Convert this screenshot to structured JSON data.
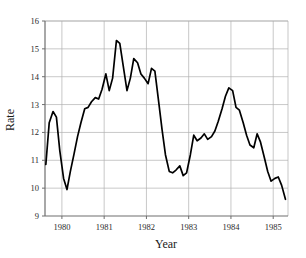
{
  "chart_data": {
    "type": "line",
    "title": "",
    "xlabel": "Year",
    "ylabel": "Rate",
    "xlim": [
      1979.6,
      1985.35
    ],
    "ylim": [
      9,
      16
    ],
    "grid": true,
    "legend": null,
    "x_ticks": [
      "1980",
      "1981",
      "1982",
      "1983",
      "1984",
      "1985"
    ],
    "x_tick_values": [
      1980,
      1981,
      1982,
      1983,
      1984,
      1985
    ],
    "y_ticks": [
      "9",
      "10",
      "11",
      "12",
      "13",
      "14",
      "15",
      "16"
    ],
    "y_tick_values": [
      9,
      10,
      11,
      12,
      13,
      14,
      15,
      16
    ],
    "series": [
      {
        "name": "Rate",
        "color": "#000000",
        "x": [
          1979.62,
          1979.7,
          1979.79,
          1979.87,
          1979.95,
          1980.04,
          1980.12,
          1980.2,
          1980.29,
          1980.37,
          1980.45,
          1980.54,
          1980.62,
          1980.7,
          1980.79,
          1980.87,
          1980.95,
          1981.04,
          1981.12,
          1981.2,
          1981.29,
          1981.37,
          1981.45,
          1981.54,
          1981.62,
          1981.7,
          1981.79,
          1981.87,
          1981.95,
          1982.04,
          1982.12,
          1982.2,
          1982.29,
          1982.37,
          1982.45,
          1982.54,
          1982.62,
          1982.7,
          1982.79,
          1982.87,
          1982.95,
          1983.04,
          1983.12,
          1983.2,
          1983.29,
          1983.37,
          1983.45,
          1983.54,
          1983.62,
          1983.7,
          1983.79,
          1983.87,
          1983.95,
          1984.04,
          1984.12,
          1984.2,
          1984.29,
          1984.37,
          1984.45,
          1984.54,
          1984.62,
          1984.7,
          1984.79,
          1984.87,
          1984.95,
          1985.04,
          1985.12,
          1985.2,
          1985.29
        ],
        "y": [
          10.85,
          12.35,
          12.75,
          12.55,
          11.35,
          10.35,
          9.95,
          10.6,
          11.25,
          11.85,
          12.35,
          12.85,
          12.9,
          13.1,
          13.25,
          13.2,
          13.55,
          14.1,
          13.5,
          13.95,
          15.3,
          15.2,
          14.4,
          13.5,
          13.95,
          14.65,
          14.5,
          14.1,
          13.95,
          13.75,
          14.3,
          14.2,
          13.1,
          12.1,
          11.2,
          10.6,
          10.55,
          10.65,
          10.8,
          10.45,
          10.55,
          11.2,
          11.9,
          11.7,
          11.8,
          11.95,
          11.75,
          11.85,
          12.05,
          12.4,
          12.85,
          13.3,
          13.6,
          13.5,
          12.9,
          12.8,
          12.35,
          11.9,
          11.55,
          11.45,
          11.95,
          11.65,
          11.1,
          10.6,
          10.25,
          10.35,
          10.4,
          10.1,
          9.6
        ]
      }
    ]
  },
  "axes": {
    "x_title": "Year",
    "y_title": "Rate"
  }
}
